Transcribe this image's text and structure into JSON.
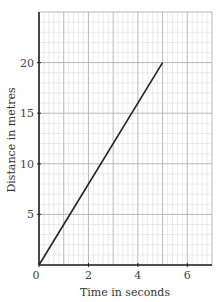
{
  "chart_data": {
    "type": "line",
    "title": "",
    "xlabel": "Time in seconds",
    "ylabel": "Distance in metres",
    "xlim": [
      0,
      7
    ],
    "ylim": [
      0,
      25
    ],
    "x_ticks": [
      0,
      2,
      4,
      6
    ],
    "y_ticks": [
      5,
      10,
      15,
      20
    ],
    "x_tick_labels": [
      "0",
      "2",
      "4",
      "6"
    ],
    "y_tick_labels": [
      "5",
      "10",
      "15",
      "20"
    ],
    "grid": true,
    "grid_minor_x": 0.2,
    "grid_minor_y": 1,
    "grid_major_x": 1,
    "grid_major_y": 5,
    "legend": null,
    "series": [
      {
        "name": "distance",
        "x": [
          0,
          5
        ],
        "y": [
          0,
          20
        ],
        "color": "#222222"
      }
    ]
  },
  "colors": {
    "axis": "#222222",
    "grid_minor": "#d6d6d6",
    "grid_major": "#b0b0b0",
    "line": "#222222"
  }
}
